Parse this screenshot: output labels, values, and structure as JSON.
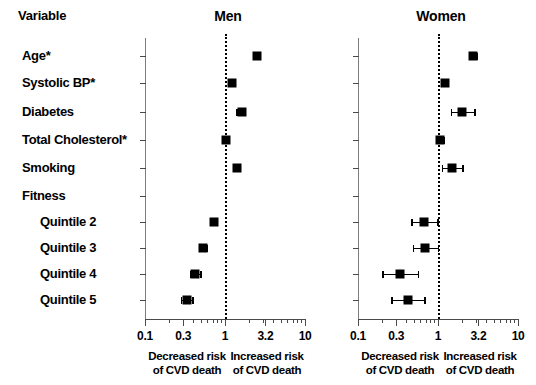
{
  "figure": {
    "variable_header": "Variable",
    "rows": [
      {
        "label": "Age*",
        "indent": false
      },
      {
        "label": "Systolic BP*",
        "indent": false
      },
      {
        "label": "Diabetes",
        "indent": false
      },
      {
        "label": "Total Cholesterol*",
        "indent": false
      },
      {
        "label": "Smoking",
        "indent": false
      },
      {
        "label": "Fitness",
        "indent": false
      },
      {
        "label": "Quintile 2",
        "indent": true
      },
      {
        "label": "Quintile 3",
        "indent": true
      },
      {
        "label": "Quintile 4",
        "indent": true
      },
      {
        "label": "Quintile 5",
        "indent": true
      }
    ],
    "panels": [
      {
        "title": "Men"
      },
      {
        "title": "Women"
      }
    ],
    "footnote_left": "Decreased risk\nof CVD death",
    "footnote_right": "Increased risk\nof CVD death",
    "footnote_left_line1": "Decreased risk",
    "footnote_left_line2": "of CVD death",
    "footnote_right_line1": "Increased risk",
    "footnote_right_line2": "of CVD death",
    "marker_color": "#000000",
    "reference_line_color": "#000000",
    "axis_color": "#4a4a4a"
  },
  "chart_data": {
    "type": "scatter",
    "title": "",
    "subtitle": "",
    "xlabel": "Hazard ratio (log scale)",
    "ylabel": "Variable",
    "xscale": "log",
    "xlim": [
      0.1,
      10
    ],
    "xticks": [
      0.1,
      0.3,
      1,
      3.2,
      10
    ],
    "xtick_labels": [
      "0.1",
      "0.3",
      "1",
      "3.2",
      "10"
    ],
    "reference_value": 1,
    "grid": false,
    "legend": "none",
    "categories": [
      "Age*",
      "Systolic BP*",
      "Diabetes",
      "Total Cholesterol*",
      "Smoking",
      "Fitness",
      "Quintile 2",
      "Quintile 3",
      "Quintile 4",
      "Quintile 5"
    ],
    "series": [
      {
        "name": "Men",
        "points": [
          {
            "category": "Age*",
            "estimate": 2.5,
            "ci_low": 2.45,
            "ci_high": 2.56
          },
          {
            "category": "Systolic BP*",
            "estimate": 1.22,
            "ci_low": 1.17,
            "ci_high": 1.28
          },
          {
            "category": "Diabetes",
            "estimate": 1.62,
            "ci_low": 1.38,
            "ci_high": 1.72
          },
          {
            "category": "Total Cholesterol*",
            "estimate": 1.03,
            "ci_low": 0.99,
            "ci_high": 1.09
          },
          {
            "category": "Smoking",
            "estimate": 1.4,
            "ci_low": 1.28,
            "ci_high": 1.5
          },
          {
            "category": "Fitness",
            "estimate": null,
            "ci_low": null,
            "ci_high": null
          },
          {
            "category": "Quintile 2",
            "estimate": 0.72,
            "ci_low": 0.68,
            "ci_high": 0.77
          },
          {
            "category": "Quintile 3",
            "estimate": 0.53,
            "ci_low": 0.49,
            "ci_high": 0.58
          },
          {
            "category": "Quintile 4",
            "estimate": 0.42,
            "ci_low": 0.36,
            "ci_high": 0.49
          },
          {
            "category": "Quintile 5",
            "estimate": 0.33,
            "ci_low": 0.28,
            "ci_high": 0.39
          }
        ]
      },
      {
        "name": "Women",
        "points": [
          {
            "category": "Age*",
            "estimate": 2.7,
            "ci_low": 2.45,
            "ci_high": 3.0
          },
          {
            "category": "Systolic BP*",
            "estimate": 1.22,
            "ci_low": 1.15,
            "ci_high": 1.3
          },
          {
            "category": "Diabetes",
            "estimate": 2.0,
            "ci_low": 1.45,
            "ci_high": 2.85
          },
          {
            "category": "Total Cholesterol*",
            "estimate": 1.05,
            "ci_low": 0.93,
            "ci_high": 1.18
          },
          {
            "category": "Smoking",
            "estimate": 1.5,
            "ci_low": 1.12,
            "ci_high": 2.0
          },
          {
            "category": "Fitness",
            "estimate": null,
            "ci_low": null,
            "ci_high": null
          },
          {
            "category": "Quintile 2",
            "estimate": 0.67,
            "ci_low": 0.46,
            "ci_high": 0.98
          },
          {
            "category": "Quintile 3",
            "estimate": 0.68,
            "ci_low": 0.48,
            "ci_high": 0.99
          },
          {
            "category": "Quintile 4",
            "estimate": 0.33,
            "ci_low": 0.2,
            "ci_high": 0.56
          },
          {
            "category": "Quintile 5",
            "estimate": 0.42,
            "ci_low": 0.26,
            "ci_high": 0.67
          }
        ]
      }
    ],
    "annotations": [
      "Decreased risk of CVD death",
      "Increased risk of CVD death"
    ]
  }
}
